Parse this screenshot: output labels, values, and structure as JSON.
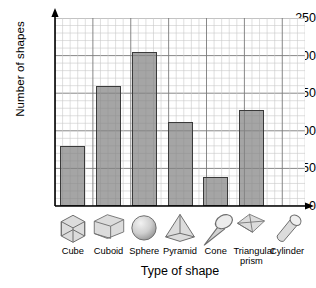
{
  "chart_data": {
    "type": "bar",
    "title": "",
    "xlabel": "Type of shape",
    "ylabel": "Number of shapes",
    "categories": [
      "Cube",
      "Cuboid",
      "Sphere",
      "Pyramid",
      "Cone",
      "Triangular prism",
      "Cylinder"
    ],
    "values": [
      80,
      160,
      205,
      112,
      38,
      128,
      0
    ],
    "ylim": [
      0,
      250
    ],
    "yticks": [
      0,
      50,
      100,
      150,
      200,
      250
    ],
    "ytick_labels": [
      "0",
      "50",
      "100",
      "150",
      "200",
      "250"
    ],
    "minor_gridline_step": 10,
    "major_gridline_step": 50,
    "grid": true,
    "legend": null,
    "bar_fill_color": "#828282",
    "bar_border_color": "#3a3a3a",
    "grid_minor_color": "#c9c9c9",
    "grid_major_color": "#7a7a7a",
    "axis_color": "#000000",
    "background_color": "#ffffff"
  },
  "axis": {
    "y_title": "Number of shapes",
    "x_title": "Type of shape"
  },
  "category_icons": [
    {
      "name": "Cube",
      "icon": "cube-icon"
    },
    {
      "name": "Cuboid",
      "icon": "cuboid-icon"
    },
    {
      "name": "Sphere",
      "icon": "sphere-icon"
    },
    {
      "name": "Pyramid",
      "icon": "pyramid-icon"
    },
    {
      "name": "Cone",
      "icon": "cone-icon"
    },
    {
      "name": "Triangular prism",
      "icon": "triangular-prism-icon"
    },
    {
      "name": "Cylinder",
      "icon": "cylinder-icon"
    }
  ]
}
